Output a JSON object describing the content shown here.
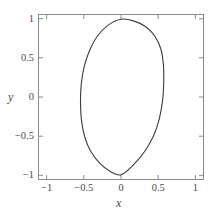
{
  "figure": {
    "background_color": "#ffffff",
    "frame_color": "#8a8a8a",
    "curve_color": "#3b3b3b",
    "text_color": "#4a4a4a"
  },
  "chart_data": {
    "type": "line",
    "title": "",
    "subtitle": "",
    "xlabel": "x",
    "ylabel": "y",
    "xlim": [
      -1.12,
      1.12
    ],
    "ylim": [
      -1.06,
      1.06
    ],
    "grid": false,
    "legend": null,
    "legend_position": "none",
    "xticks": [
      -1,
      -0.5,
      0,
      0.5,
      1
    ],
    "xtick_labels": [
      "−1",
      "−0.5",
      "0",
      "0.5",
      "1"
    ],
    "yticks": [
      -1,
      -0.5,
      0,
      0.5,
      1
    ],
    "ytick_labels": [
      "−1",
      "−0.5",
      "0",
      "0.5",
      "1"
    ],
    "tick_direction": "in",
    "annotations": [],
    "series": [
      {
        "name": "closed curve",
        "closed": true,
        "description": "closed oval (egg-like) curve, vertical extent y = -1 to 1 at x = 0, horizontal extent x = -0.55 to 0.58",
        "x_extent": [
          -0.55,
          0.58
        ],
        "y_extent": [
          -1.0,
          1.0
        ],
        "x": [
          0.0,
          0.18,
          0.34,
          0.46,
          0.54,
          0.575,
          0.58,
          0.565,
          0.52,
          0.44,
          0.32,
          0.17,
          0.0,
          -0.15,
          -0.29,
          -0.41,
          -0.49,
          -0.535,
          -0.55,
          -0.54,
          -0.5,
          -0.425,
          -0.315,
          -0.165,
          0.0
        ],
        "y": [
          1.0,
          0.975,
          0.9,
          0.78,
          0.62,
          0.42,
          0.2,
          -0.04,
          -0.28,
          -0.5,
          -0.7,
          -0.87,
          -1.0,
          -0.955,
          -0.85,
          -0.7,
          -0.52,
          -0.31,
          -0.08,
          0.16,
          0.39,
          0.6,
          0.79,
          0.93,
          1.0
        ]
      }
    ]
  }
}
